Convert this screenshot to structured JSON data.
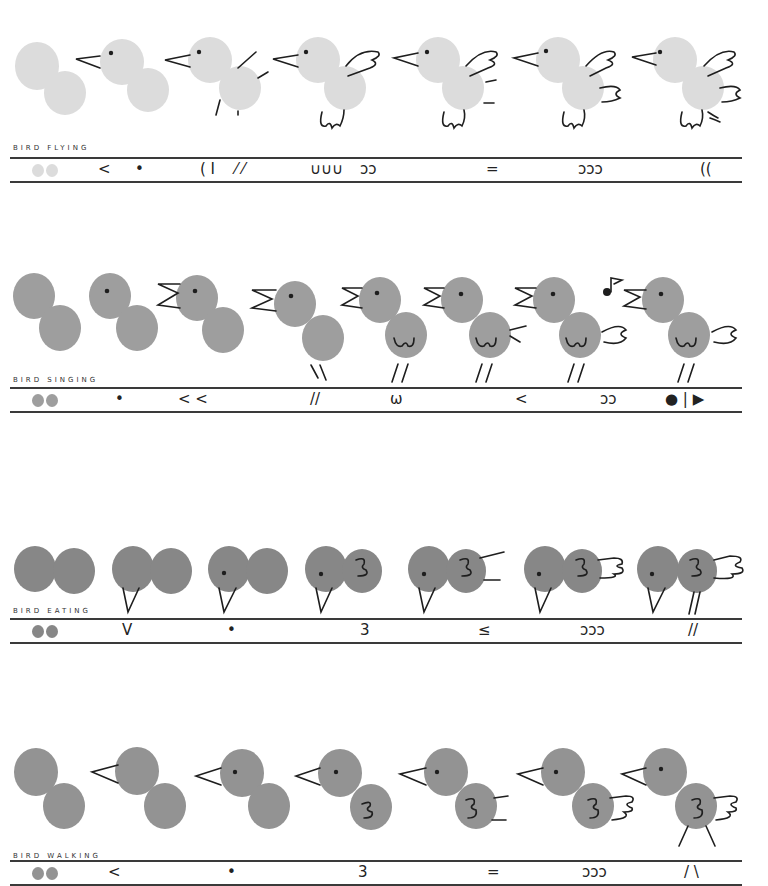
{
  "colors": {
    "flying": "#dcdcdc",
    "singing": "#9e9e9e",
    "eating": "#878787",
    "walking": "#939393",
    "ink": "#1e1e1e",
    "rule": "#3a3a3a"
  },
  "sections": [
    {
      "id": "flying",
      "label": "BIRD FLYING",
      "strokes": [
        {
          "x": 90,
          "text": "<"
        },
        {
          "x": 135,
          "text": "•"
        },
        {
          "x": 200,
          "text": "( I"
        },
        {
          "x": 235,
          "text": "⁄ ⁄"
        },
        {
          "x": 310,
          "text": "∪∪∪"
        },
        {
          "x": 358,
          "text": "ↄↄ"
        },
        {
          "x": 486,
          "text": "="
        },
        {
          "x": 578,
          "text": "ↄↄↄ"
        },
        {
          "x": 700,
          "text": "(("
        }
      ]
    },
    {
      "id": "singing",
      "label": "BIRD SINGING",
      "strokes": [
        {
          "x": 115,
          "text": "•"
        },
        {
          "x": 178,
          "text": "< <"
        },
        {
          "x": 310,
          "text": "//"
        },
        {
          "x": 390,
          "text": "ω"
        },
        {
          "x": 515,
          "text": "<"
        },
        {
          "x": 600,
          "text": "ↄↄ"
        },
        {
          "x": 665,
          "text": "● | ▶"
        }
      ]
    },
    {
      "id": "eating",
      "label": "BIRD EATING",
      "strokes": [
        {
          "x": 122,
          "text": "V"
        },
        {
          "x": 227,
          "text": "•"
        },
        {
          "x": 360,
          "text": "3"
        },
        {
          "x": 478,
          "text": "≤"
        },
        {
          "x": 580,
          "text": "ↄↄↄ"
        },
        {
          "x": 688,
          "text": "//"
        }
      ]
    },
    {
      "id": "walking",
      "label": "BIRD WALKING",
      "strokes": [
        {
          "x": 108,
          "text": "<"
        },
        {
          "x": 227,
          "text": "•"
        },
        {
          "x": 358,
          "text": "3"
        },
        {
          "x": 487,
          "text": "="
        },
        {
          "x": 582,
          "text": "ↄↄↄ"
        },
        {
          "x": 684,
          "text": "/ \\"
        }
      ]
    }
  ]
}
